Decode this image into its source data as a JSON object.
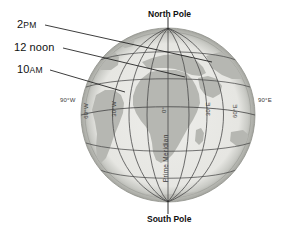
{
  "figure": {
    "background": "#ffffff",
    "ocean_color": "#e9e9e6",
    "land_color": "#b6b7b2",
    "limb_color": "#a9aaa5",
    "grid_color": "#4a4a4a",
    "leader_color": "#1a1a1a"
  },
  "poles": {
    "north": "North Pole",
    "south": "South Pole"
  },
  "time_labels": [
    {
      "id": "t-2pm",
      "text_main": "2",
      "text_small": "PM",
      "full": "2 PM"
    },
    {
      "id": "t-noon",
      "text_main": "12 noon",
      "text_small": "",
      "full": "12 noon"
    },
    {
      "id": "t-10am",
      "text_main": "10",
      "text_small": "AM",
      "full": "10 AM"
    }
  ],
  "meridians": [
    {
      "id": "m-90w",
      "label": "90°W",
      "orientation": "horizontal"
    },
    {
      "id": "m-60w",
      "label": "60°W",
      "orientation": "vertical"
    },
    {
      "id": "m-30w",
      "label": "30°W",
      "orientation": "vertical"
    },
    {
      "id": "m-0",
      "label": "0°",
      "orientation": "vertical"
    },
    {
      "id": "m-30e",
      "label": "30°E",
      "orientation": "vertical"
    },
    {
      "id": "m-60e",
      "label": "60°E",
      "orientation": "vertical"
    },
    {
      "id": "m-90e",
      "label": "90°E",
      "orientation": "horizontal"
    }
  ],
  "prime_meridian": {
    "label": "Prime Meridian"
  }
}
